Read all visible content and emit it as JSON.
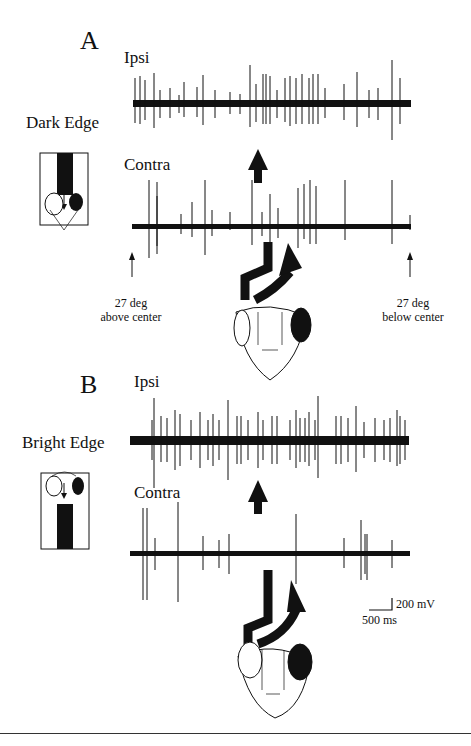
{
  "figure": {
    "panels": [
      {
        "letter": "A",
        "condition": "Dark Edge",
        "traces": [
          {
            "label": "Ipsi"
          },
          {
            "label": "Contra"
          }
        ],
        "annotations": {
          "left_arrow": "27 deg\nabove center",
          "left_line1": "27 deg",
          "left_line2": "above center",
          "right_line1": "27 deg",
          "right_line2": "below center"
        }
      },
      {
        "letter": "B",
        "condition": "Bright Edge",
        "traces": [
          {
            "label": "Ipsi"
          },
          {
            "label": "Contra"
          }
        ]
      }
    ],
    "scale_bar": {
      "voltage": "200 mV",
      "time": "500 ms"
    }
  },
  "colors": {
    "ink": "#111111",
    "background": "#ffffff"
  }
}
